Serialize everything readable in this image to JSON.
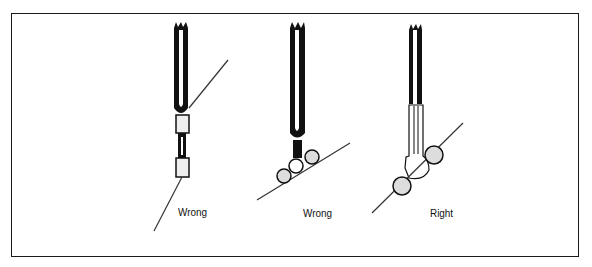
{
  "figure": {
    "panels": [
      {
        "id": "panel-1",
        "label": "Wrong",
        "description": "tweezer tip with tube sleeve connector on wire"
      },
      {
        "id": "panel-2",
        "label": "Wrong",
        "description": "tweezer tip with spherical contacts on wire"
      },
      {
        "id": "panel-3",
        "label": "Right",
        "description": "flat forked tip holding wire between spherical contacts"
      }
    ]
  },
  "colors": {
    "ink": "#111111",
    "background": "#ffffff"
  }
}
